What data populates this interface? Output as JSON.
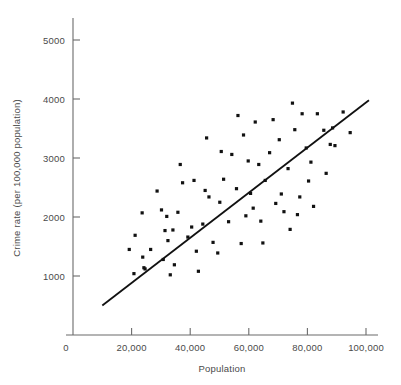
{
  "chart_data": {
    "type": "scatter",
    "title": "",
    "subtitle": "",
    "xlabel": "Population",
    "ylabel": "Crime rate (per 100,000 population)",
    "xlim": [
      0,
      105000
    ],
    "ylim": [
      0,
      5400
    ],
    "xticks": [
      0,
      20000,
      40000,
      60000,
      80000,
      100000
    ],
    "xticklabels": [
      "0",
      "20,000",
      "40,000",
      "60,000",
      "80,000",
      "100,000"
    ],
    "yticks": [
      1000,
      2000,
      3000,
      4000,
      5000
    ],
    "yticklabels": [
      "1000",
      "2000",
      "3000",
      "4000",
      "5000"
    ],
    "grid": false,
    "legend": null,
    "legend_position": "none",
    "marker_color": "#111111",
    "line_color": "#111111",
    "axis_color": "#6b6b6b",
    "annotations": [],
    "trendline": {
      "type": "linear",
      "x_start": 10000,
      "y_start": 500,
      "x_end": 101000,
      "y_end": 3980
    },
    "points": [
      {
        "x": 19200,
        "y": 1450
      },
      {
        "x": 20800,
        "y": 1040
      },
      {
        "x": 21200,
        "y": 1690
      },
      {
        "x": 23600,
        "y": 2070
      },
      {
        "x": 23800,
        "y": 1320
      },
      {
        "x": 24200,
        "y": 1140
      },
      {
        "x": 24600,
        "y": 1120
      },
      {
        "x": 26500,
        "y": 1450
      },
      {
        "x": 28700,
        "y": 2440
      },
      {
        "x": 30200,
        "y": 2120
      },
      {
        "x": 30800,
        "y": 1280
      },
      {
        "x": 31400,
        "y": 1770
      },
      {
        "x": 32000,
        "y": 2010
      },
      {
        "x": 32400,
        "y": 1600
      },
      {
        "x": 33200,
        "y": 1020
      },
      {
        "x": 34100,
        "y": 1780
      },
      {
        "x": 34600,
        "y": 1190
      },
      {
        "x": 35800,
        "y": 2080
      },
      {
        "x": 36600,
        "y": 2890
      },
      {
        "x": 37400,
        "y": 2580
      },
      {
        "x": 39200,
        "y": 1660
      },
      {
        "x": 40500,
        "y": 1830
      },
      {
        "x": 41300,
        "y": 2620
      },
      {
        "x": 42100,
        "y": 1420
      },
      {
        "x": 42800,
        "y": 1080
      },
      {
        "x": 44300,
        "y": 1880
      },
      {
        "x": 45100,
        "y": 2450
      },
      {
        "x": 45600,
        "y": 3340
      },
      {
        "x": 46400,
        "y": 2340
      },
      {
        "x": 47800,
        "y": 1570
      },
      {
        "x": 49400,
        "y": 1390
      },
      {
        "x": 50100,
        "y": 2250
      },
      {
        "x": 50600,
        "y": 3110
      },
      {
        "x": 51400,
        "y": 2640
      },
      {
        "x": 53100,
        "y": 1920
      },
      {
        "x": 54200,
        "y": 3060
      },
      {
        "x": 55800,
        "y": 2480
      },
      {
        "x": 56300,
        "y": 3720
      },
      {
        "x": 57400,
        "y": 1550
      },
      {
        "x": 58200,
        "y": 3390
      },
      {
        "x": 59000,
        "y": 2020
      },
      {
        "x": 59800,
        "y": 2950
      },
      {
        "x": 60600,
        "y": 2400
      },
      {
        "x": 61500,
        "y": 2150
      },
      {
        "x": 62200,
        "y": 3610
      },
      {
        "x": 63400,
        "y": 2890
      },
      {
        "x": 64100,
        "y": 1930
      },
      {
        "x": 64800,
        "y": 1560
      },
      {
        "x": 65600,
        "y": 2620
      },
      {
        "x": 67100,
        "y": 3090
      },
      {
        "x": 68300,
        "y": 3650
      },
      {
        "x": 69200,
        "y": 2230
      },
      {
        "x": 70400,
        "y": 3310
      },
      {
        "x": 71100,
        "y": 2390
      },
      {
        "x": 72000,
        "y": 2090
      },
      {
        "x": 73400,
        "y": 2820
      },
      {
        "x": 74100,
        "y": 1790
      },
      {
        "x": 74900,
        "y": 3930
      },
      {
        "x": 75700,
        "y": 3480
      },
      {
        "x": 76600,
        "y": 2040
      },
      {
        "x": 77400,
        "y": 2340
      },
      {
        "x": 78200,
        "y": 3750
      },
      {
        "x": 79600,
        "y": 3170
      },
      {
        "x": 80400,
        "y": 2610
      },
      {
        "x": 81200,
        "y": 2930
      },
      {
        "x": 82100,
        "y": 2180
      },
      {
        "x": 83400,
        "y": 3750
      },
      {
        "x": 85600,
        "y": 3470
      },
      {
        "x": 86400,
        "y": 2740
      },
      {
        "x": 87800,
        "y": 3230
      },
      {
        "x": 88600,
        "y": 3510
      },
      {
        "x": 89400,
        "y": 3210
      },
      {
        "x": 92200,
        "y": 3780
      },
      {
        "x": 94600,
        "y": 3430
      }
    ]
  }
}
